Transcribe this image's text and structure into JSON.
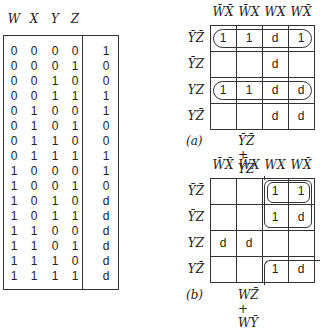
{
  "truth_table": {
    "headers": [
      "W",
      "X",
      "Y",
      "Z"
    ],
    "rows": [
      {
        "inputs": [
          "0",
          "0",
          "0",
          "0"
        ],
        "out": "1"
      },
      {
        "inputs": [
          "0",
          "0",
          "0",
          "1"
        ],
        "out": "0"
      },
      {
        "inputs": [
          "0",
          "0",
          "1",
          "0"
        ],
        "out": "0"
      },
      {
        "inputs": [
          "0",
          "0",
          "1",
          "1"
        ],
        "out": "1"
      },
      {
        "inputs": [
          "0",
          "1",
          "0",
          "0"
        ],
        "out": "1"
      },
      {
        "inputs": [
          "0",
          "1",
          "0",
          "1"
        ],
        "out": "0"
      },
      {
        "inputs": [
          "0",
          "1",
          "1",
          "0"
        ],
        "out": "0"
      },
      {
        "inputs": [
          "0",
          "1",
          "1",
          "1"
        ],
        "out": "1"
      },
      {
        "inputs": [
          "1",
          "0",
          "0",
          "0"
        ],
        "out": "1"
      },
      {
        "inputs": [
          "1",
          "0",
          "0",
          "1"
        ],
        "out": "0"
      },
      {
        "inputs": [
          "1",
          "0",
          "1",
          "0"
        ],
        "out": "d"
      },
      {
        "inputs": [
          "1",
          "0",
          "1",
          "1"
        ],
        "out": "d"
      },
      {
        "inputs": [
          "1",
          "1",
          "0",
          "0"
        ],
        "out": "d"
      },
      {
        "inputs": [
          "1",
          "1",
          "0",
          "1"
        ],
        "out": "d"
      },
      {
        "inputs": [
          "1",
          "1",
          "1",
          "0"
        ],
        "out": "d"
      },
      {
        "inputs": [
          "1",
          "1",
          "1",
          "1"
        ],
        "out": "d"
      }
    ]
  },
  "kmap_a": {
    "label": "(a)",
    "expression": "ȲZ̄ + YZ",
    "col_headers": [
      "W̄X̄",
      "W̄X",
      "WX",
      "WX̄"
    ],
    "row_headers": [
      "ȲZ̄",
      "ȲZ",
      "YZ",
      "YZ̄"
    ],
    "cells": [
      [
        "1",
        "1",
        "d",
        "1"
      ],
      [
        "",
        "",
        "d",
        ""
      ],
      [
        "1",
        "1",
        "d",
        "d"
      ],
      [
        "",
        "",
        "d",
        "d"
      ]
    ]
  },
  "kmap_b": {
    "label": "(b)",
    "expression": "WZ̄ + WȲ",
    "col_headers": [
      "W̄X̄",
      "W̄X",
      "WX",
      "WX̄"
    ],
    "row_headers": [
      "ȲZ̄",
      "ȲZ",
      "YZ",
      "YZ̄"
    ],
    "cells": [
      [
        "",
        "",
        "1",
        "1"
      ],
      [
        "",
        "",
        "1",
        "d"
      ],
      [
        "d",
        "d",
        "",
        ""
      ],
      [
        "",
        "",
        "1",
        "d"
      ]
    ]
  }
}
